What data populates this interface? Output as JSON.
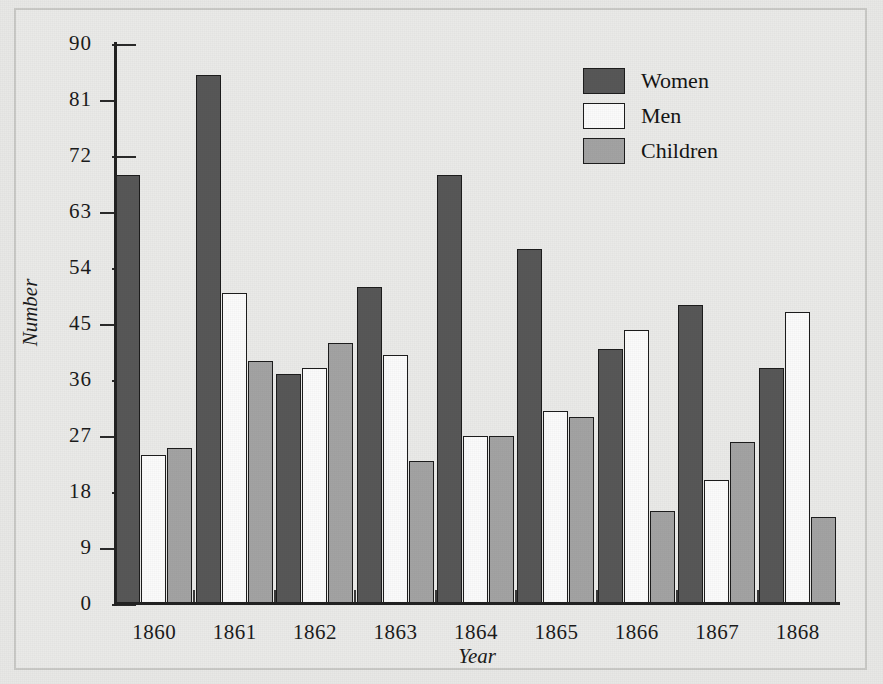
{
  "chart_data": {
    "type": "bar",
    "title": "",
    "xlabel": "Year",
    "ylabel": "Number",
    "categories": [
      "1860",
      "1861",
      "1862",
      "1863",
      "1864",
      "1865",
      "1866",
      "1867",
      "1868"
    ],
    "series": [
      {
        "name": "Women",
        "color": "#575757",
        "values": [
          69,
          85,
          37,
          51,
          69,
          57,
          41,
          48,
          38
        ]
      },
      {
        "name": "Men",
        "color": "#fbfbfb",
        "values": [
          24,
          50,
          38,
          40,
          27,
          31,
          44,
          20,
          47
        ]
      },
      {
        "name": "Children",
        "color": "#a3a3a3",
        "values": [
          25,
          39,
          42,
          23,
          27,
          30,
          15,
          26,
          14
        ]
      }
    ],
    "ylim": [
      0,
      90
    ],
    "yticks": [
      0,
      9,
      18,
      27,
      36,
      45,
      54,
      63,
      72,
      81,
      90
    ],
    "ytick_labels": [
      "0",
      "9",
      "18",
      "27",
      "36",
      "45",
      "54",
      "63",
      "72",
      "81",
      "90"
    ],
    "grid": false,
    "legend_position": "top-right",
    "legend_entries": [
      "Women",
      "Men",
      "Children"
    ]
  },
  "figure": {
    "background_color": "#e8e8e6",
    "axis_color": "#222222",
    "border_color": "#c9c9c6"
  }
}
